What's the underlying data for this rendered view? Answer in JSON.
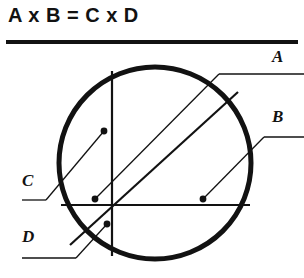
{
  "title": "A x B = C x D",
  "diagram": {
    "name": "intersecting-chords-circle",
    "colors": {
      "ink": "#121212",
      "background": "#ffffff"
    },
    "circle": {
      "cx": 155,
      "cy": 163,
      "r": 96,
      "stroke_width": 5
    },
    "chords": [
      {
        "id": "vertical-chord",
        "x1": 112,
        "y1": 71,
        "x2": 112,
        "y2": 256,
        "stroke_width": 2
      },
      {
        "id": "horizontal-chord",
        "x1": 61,
        "y1": 205,
        "x2": 250,
        "y2": 205,
        "stroke_width": 2
      },
      {
        "id": "diagonal-chord",
        "x1": 70,
        "y1": 245,
        "x2": 238,
        "y2": 92,
        "stroke_width": 2
      }
    ],
    "labels": [
      {
        "id": "a",
        "text": "A",
        "x": 272,
        "y": 48,
        "leader": {
          "hx1": 304,
          "hx2": 219,
          "hy": 74,
          "dot_x": 95,
          "dot_y": 199
        }
      },
      {
        "id": "b",
        "text": "B",
        "x": 272,
        "y": 108,
        "leader": {
          "hx1": 304,
          "hx2": 264,
          "hy": 137,
          "dot_x": 203,
          "dot_y": 199
        }
      },
      {
        "id": "c",
        "text": "C",
        "x": 22,
        "y": 172,
        "leader": {
          "hx1": 22,
          "hx2": 46,
          "hy": 200,
          "dot_x": 104,
          "dot_y": 131
        }
      },
      {
        "id": "d",
        "text": "D",
        "x": 22,
        "y": 228,
        "leader": {
          "hx1": 22,
          "hx2": 76,
          "hy": 258,
          "dot_x": 107,
          "dot_y": 224
        }
      }
    ]
  }
}
